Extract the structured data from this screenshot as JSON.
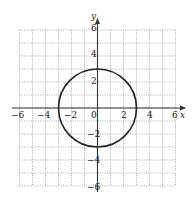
{
  "chart_data": {
    "type": "line",
    "title": "",
    "xlabel": "x",
    "ylabel": "y",
    "xlim": [
      -6,
      6
    ],
    "ylim": [
      -6,
      6
    ],
    "grid": true,
    "x_ticks": [
      "-6",
      "-4",
      "-2",
      "0",
      "2",
      "4",
      "6"
    ],
    "y_ticks": [
      "6",
      "4",
      "2",
      "-2",
      "-4",
      "-6"
    ],
    "series": [
      {
        "name": "circle",
        "shape": "circle",
        "center": [
          0,
          0
        ],
        "radius": 3,
        "equation": "x^2 + y^2 = 9"
      }
    ]
  },
  "labels": {
    "x_axis": "x",
    "y_axis": "y",
    "xt": {
      "m6": "−6",
      "m4": "−4",
      "m2": "−2",
      "z": "0",
      "p2": "2",
      "p4": "4",
      "p6": "6"
    },
    "yt": {
      "p6": "6",
      "p4": "4",
      "p2": "2",
      "m2": "−2",
      "m4": "−4",
      "m6": "−6"
    }
  }
}
